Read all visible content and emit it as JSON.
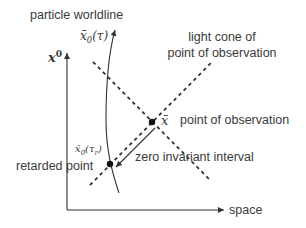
{
  "labels": {
    "worldline": "particle worldline",
    "worldline_param": "x̄",
    "worldline_param_sub": "0",
    "worldline_param_arg": "(τ)",
    "time_axis": "x",
    "time_axis_sup": "0",
    "light_cone_line1": "light cone of",
    "light_cone_line2": "point of observation",
    "observation_symbol": "x̄",
    "observation_point": "point of observation",
    "zero_interval": "zero invariant interval",
    "retarded_param": "x̄",
    "retarded_param_sub": "0",
    "retarded_param_arg": "(τ",
    "retarded_param_arg_sub": "r",
    "retarded_param_close": ")",
    "retarded_point": "retarded point",
    "space_axis": "space"
  },
  "colors": {
    "line": "#333333",
    "text": "#3a3a3a",
    "background": "#ffffff"
  },
  "geometry": {
    "observation_point": [
      152,
      122
    ],
    "retarded_point": [
      110,
      164
    ]
  }
}
